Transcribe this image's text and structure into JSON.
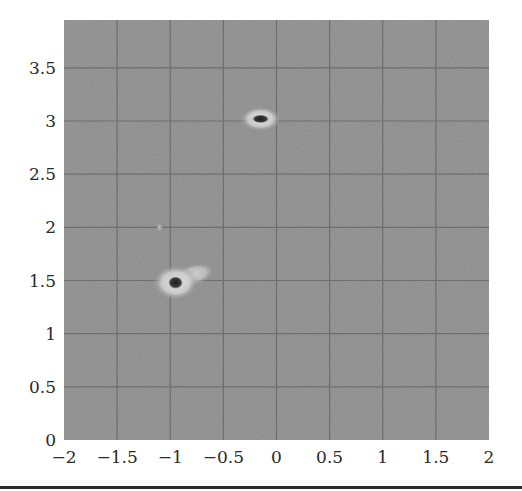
{
  "chart_data": {
    "type": "heatmap",
    "title": "",
    "xlabel": "",
    "ylabel": "",
    "xlim": [
      -2,
      2
    ],
    "ylim": [
      0,
      3.95
    ],
    "grid": true,
    "x_ticks": [
      "−2",
      "−1.5",
      "−1",
      "−0.5",
      "0",
      "0.5",
      "1",
      "1.5",
      "2"
    ],
    "x_tick_values": [
      -2,
      -1.5,
      -1,
      -0.5,
      0,
      0.5,
      1,
      1.5,
      2
    ],
    "y_ticks": [
      "0",
      "0.5",
      "1",
      "1.5",
      "2",
      "2.5",
      "3",
      "3.5"
    ],
    "y_tick_values": [
      0,
      0.5,
      1,
      1.5,
      2,
      2.5,
      3,
      3.5
    ],
    "background_level": "uniform mid-gray noise",
    "colors": {
      "background": "#8a8a8a",
      "grid": "#6e6e6e",
      "halo": "#d8d8d8",
      "core": "#2a2a2a"
    },
    "features": [
      {
        "name": "peak-upper",
        "x": -0.15,
        "y": 3.02,
        "core_rx": 0.08,
        "core_ry": 0.04,
        "halo_rx": 0.2,
        "halo_ry": 0.12,
        "intensity": "strong"
      },
      {
        "name": "peak-lower",
        "x": -0.95,
        "y": 1.48,
        "core_rx": 0.07,
        "core_ry": 0.06,
        "halo_rx": 0.22,
        "halo_ry": 0.17,
        "intensity": "strong",
        "tail_direction": "upper-right"
      },
      {
        "name": "faint-spot",
        "x": -1.1,
        "y": 2.0,
        "core_rx": 0.04,
        "core_ry": 0.06,
        "intensity": "weak"
      }
    ]
  }
}
